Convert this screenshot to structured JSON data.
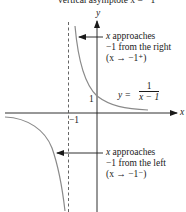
{
  "caption": "vertical asymptote x = −1",
  "axes": {
    "x_label": "x",
    "y_label": "y",
    "tick_neg1": "−1",
    "tick_y1": "1"
  },
  "function_label": {
    "lhs": "y =",
    "numerator": "1",
    "denominator": "x − 1"
  },
  "annotations": {
    "right": {
      "line1_var": "x",
      "line1_rest": " approaches",
      "line2": "−1 from the right",
      "line3": "(x → −1⁺)"
    },
    "left": {
      "line1_var": "x",
      "line1_rest": " approaches",
      "line2": "−1 from the left",
      "line3": "(x → −1⁻)"
    }
  },
  "colors": {
    "curve": "#8a8a8a",
    "axes": "#1a1a1a",
    "asymptote": "#555555",
    "text": "#1a1a1a"
  }
}
